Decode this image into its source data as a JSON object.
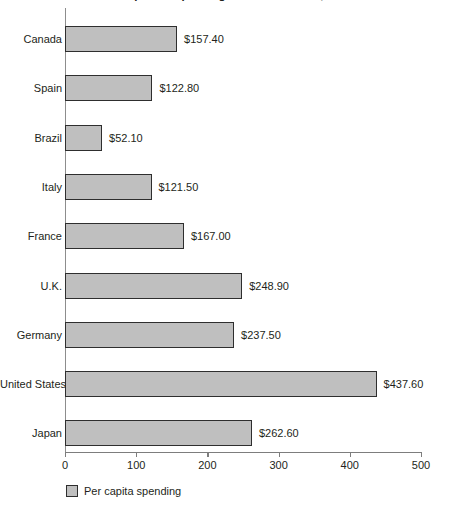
{
  "chart_data": {
    "type": "bar",
    "orientation": "horizontal",
    "title": "Per capita Ad spending around the world, 1998",
    "xlabel": "",
    "ylabel": "",
    "xlim": [
      0,
      500
    ],
    "xticks": [
      0,
      100,
      200,
      300,
      400,
      500
    ],
    "xtick_labels": [
      "0",
      "100",
      "200",
      "300",
      "400",
      "500"
    ],
    "grid": false,
    "legend_position": "bottom-left",
    "legend": [
      "Per capita spending"
    ],
    "bar_color": "#bfbfbf",
    "bar_border_color": "#2e2e2e",
    "axis_color": "#7d7d7d",
    "categories": [
      "Canada",
      "Spain",
      "Brazil",
      "Italy",
      "France",
      "U.K.",
      "Germany",
      "United States",
      "Japan"
    ],
    "values": [
      157.4,
      122.8,
      52.1,
      121.5,
      167.0,
      248.9,
      237.5,
      437.6,
      262.6
    ],
    "value_labels": [
      "$157.40",
      "$122.80",
      "$52.10",
      "$121.50",
      "$167.00",
      "$248.90",
      "$237.50",
      "$437.60",
      "$262.60"
    ],
    "series": [
      {
        "name": "Per capita spending",
        "values": [
          157.4,
          122.8,
          52.1,
          121.5,
          167.0,
          248.9,
          237.5,
          437.6,
          262.6
        ]
      }
    ]
  }
}
